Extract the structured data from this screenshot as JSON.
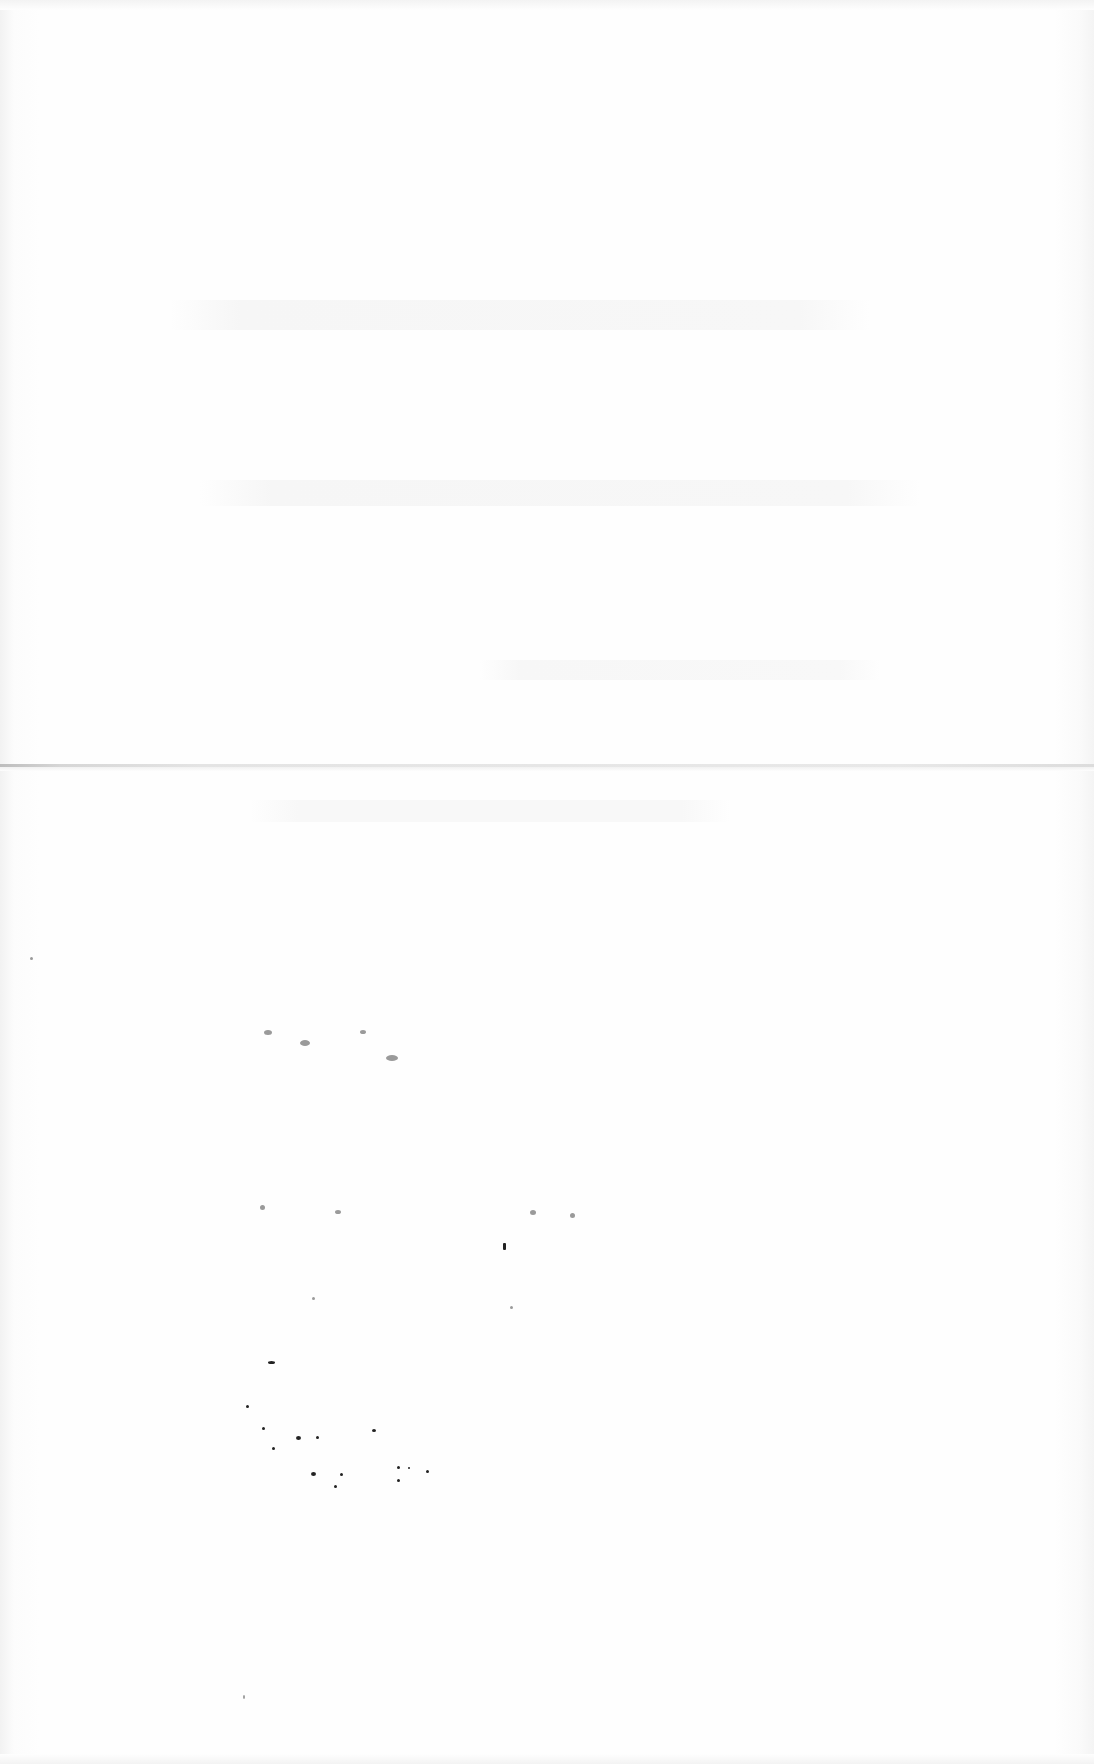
{
  "document": {
    "type": "scanned-page",
    "content_text": "",
    "legible_text_present": false
  },
  "features": {
    "fold_line_y": 765,
    "background_color": "#fdfdfd",
    "fold_color": "#d6d6d6",
    "speck_color": "#222222"
  }
}
